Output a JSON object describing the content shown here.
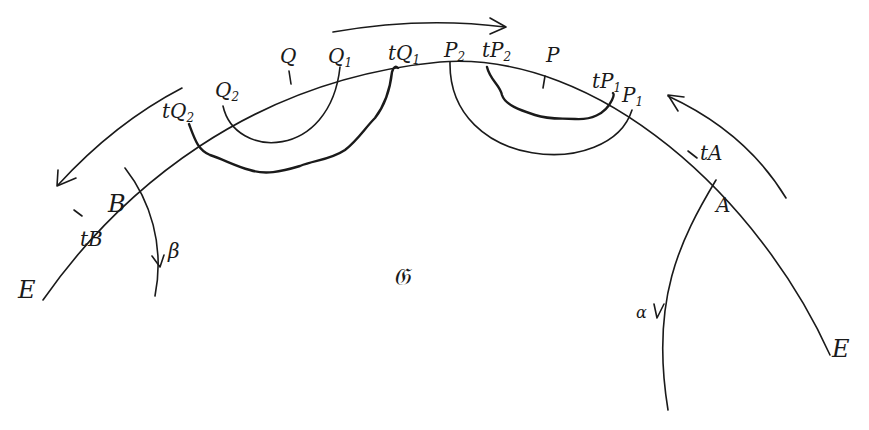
{
  "diagram": {
    "region_label": "𝔊",
    "boundary_endpoints": [
      "E",
      "E"
    ],
    "points": {
      "tQ2": {
        "base": "tQ",
        "sub": "2"
      },
      "Q2": {
        "base": "Q",
        "sub": "2"
      },
      "Q": {
        "base": "Q",
        "sub": ""
      },
      "Q1": {
        "base": "Q",
        "sub": "1"
      },
      "tQ1": {
        "base": "tQ",
        "sub": "1"
      },
      "P2": {
        "base": "P",
        "sub": "2"
      },
      "tP2": {
        "base": "tP",
        "sub": "2"
      },
      "P": {
        "base": "P",
        "sub": ""
      },
      "tP1": {
        "base": "tP",
        "sub": "1"
      },
      "P1": {
        "base": "P",
        "sub": "1"
      },
      "tA": {
        "base": "tA",
        "sub": ""
      },
      "A": {
        "base": "A",
        "sub": ""
      },
      "B": {
        "base": "B",
        "sub": ""
      },
      "tB": {
        "base": "tB",
        "sub": ""
      }
    },
    "curves": {
      "alpha": "α",
      "beta": "β"
    },
    "arrows": [
      {
        "name": "top-arrow",
        "direction": "right"
      },
      {
        "name": "left-arrow",
        "direction": "down-left"
      },
      {
        "name": "right-arrow",
        "direction": "up-left"
      }
    ]
  }
}
